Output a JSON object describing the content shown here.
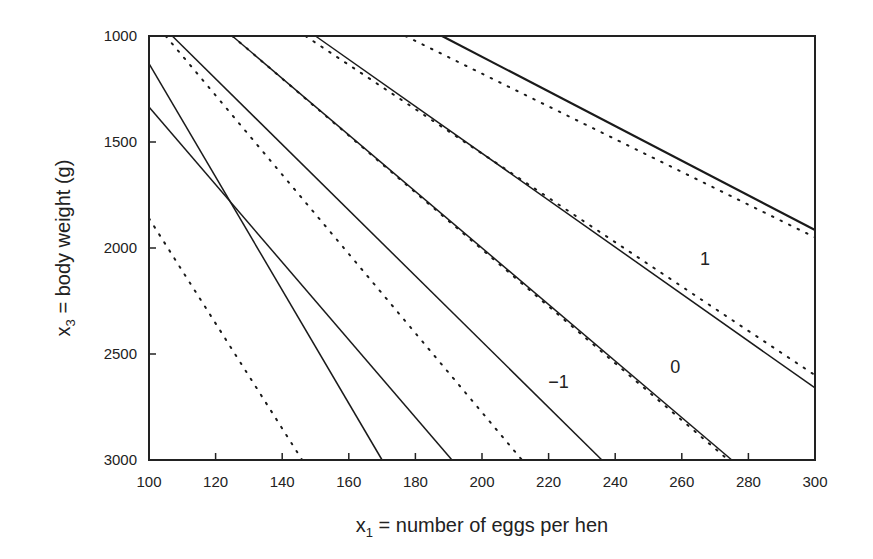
{
  "chart_data": {
    "type": "line",
    "title": "",
    "xlabel": "x1 = number of eggs per hen",
    "xlabel_main": "x",
    "xlabel_sub": "1",
    "xlabel_rest": " = number of eggs per hen",
    "ylabel": "x3 = body weight (g)",
    "ylabel_main": "x",
    "ylabel_sub": "3",
    "ylabel_rest": " = body weight (g)",
    "xlim": [
      100,
      300
    ],
    "ylim": [
      1000,
      3000
    ],
    "y_inverted": true,
    "grid": false,
    "legend": "none",
    "x_ticks": [
      100,
      120,
      140,
      160,
      180,
      200,
      220,
      240,
      260,
      280,
      300
    ],
    "y_ticks": [
      1000,
      1500,
      2000,
      2500,
      3000
    ],
    "series": [
      {
        "name": "solid-1",
        "style": "solid",
        "x": [
          100,
          170
        ],
        "y": [
          1130,
          3000
        ]
      },
      {
        "name": "solid-2",
        "style": "solid",
        "x": [
          100,
          191
        ],
        "y": [
          1335,
          3000
        ]
      },
      {
        "name": "solid-3",
        "style": "solid",
        "x": [
          107,
          236
        ],
        "y": [
          1000,
          3000
        ]
      },
      {
        "name": "solid-4",
        "style": "solid",
        "x": [
          125,
          275
        ],
        "y": [
          1000,
          3000
        ]
      },
      {
        "name": "solid-5",
        "style": "solid",
        "x": [
          150,
          300
        ],
        "y": [
          1000,
          2660
        ]
      },
      {
        "name": "solid-6",
        "style": "solid",
        "x": [
          188,
          300
        ],
        "y": [
          1000,
          1915
        ]
      },
      {
        "name": "dotted-1",
        "style": "dotted",
        "x": [
          100,
          146
        ],
        "y": [
          1860,
          3000
        ]
      },
      {
        "name": "dotted-2",
        "style": "dotted",
        "x": [
          105,
          212
        ],
        "y": [
          1000,
          3000
        ]
      },
      {
        "name": "dotted-3",
        "style": "dotted",
        "x": [
          125,
          274
        ],
        "y": [
          1000,
          3000
        ]
      },
      {
        "name": "dotted-4",
        "style": "dotted",
        "x": [
          147,
          300
        ],
        "y": [
          1000,
          2600
        ]
      },
      {
        "name": "dotted-5",
        "style": "dotted",
        "x": [
          177,
          300
        ],
        "y": [
          1000,
          1950
        ]
      }
    ],
    "annotations": [
      {
        "text": "1",
        "x": 267,
        "y": 2050
      },
      {
        "text": "0",
        "x": 258,
        "y": 2560
      },
      {
        "text": "−1",
        "x": 223,
        "y": 2630
      }
    ]
  },
  "layout": {
    "plot": {
      "left": 149,
      "right": 815,
      "top": 36,
      "bottom": 460
    },
    "colors": {
      "line": "#1a1a1a",
      "frame": "#222222",
      "background": "#ffffff"
    }
  }
}
